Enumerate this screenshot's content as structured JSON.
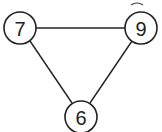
{
  "graph": {
    "nodes": [
      {
        "id": "n7",
        "label": "7",
        "x": 20,
        "y": 28
      },
      {
        "id": "n9",
        "label": "9",
        "x": 141,
        "y": 28
      },
      {
        "id": "n6",
        "label": "6",
        "x": 81,
        "y": 117
      }
    ],
    "edges": [
      {
        "from": "7",
        "to": "9"
      },
      {
        "from": "7",
        "to": "6"
      },
      {
        "from": "9",
        "to": "6"
      }
    ],
    "node_radius": 16,
    "colors": {
      "stroke": "#222222",
      "fill": "#ffffff"
    }
  }
}
